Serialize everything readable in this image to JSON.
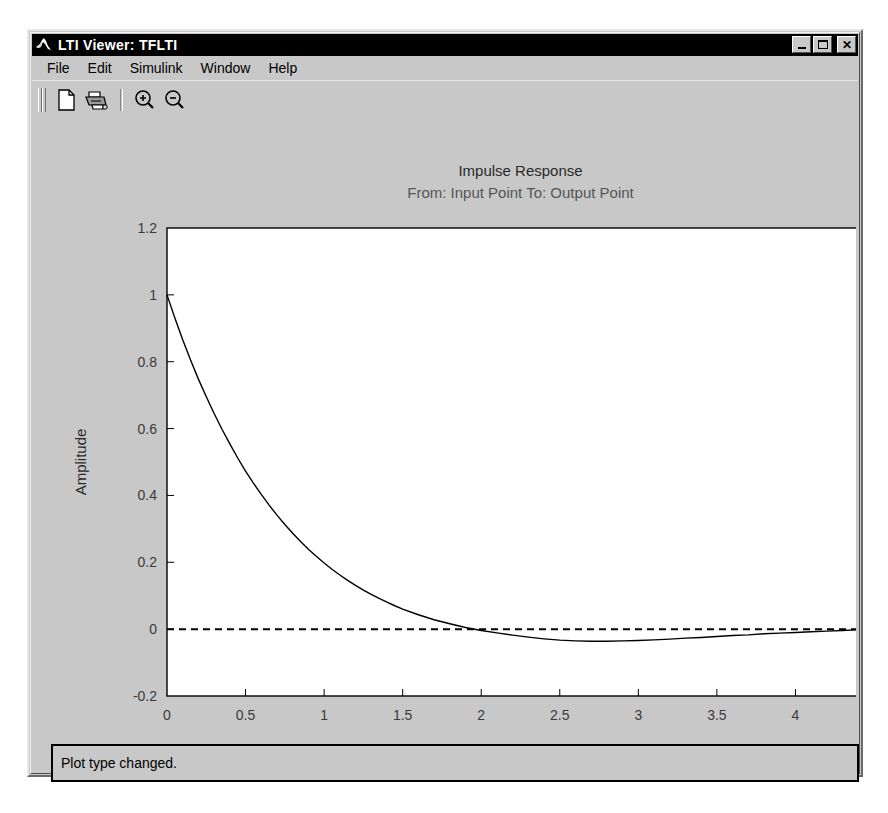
{
  "window": {
    "title": "LTI Viewer: TFLTI",
    "icon": "matlab-membrane-icon",
    "controls": [
      {
        "name": "minimize-button",
        "glyph": "minimize"
      },
      {
        "name": "maximize-button",
        "glyph": "maximize"
      },
      {
        "name": "close-button",
        "glyph": "close",
        "label": "✕"
      }
    ]
  },
  "menubar": {
    "items": [
      {
        "label": "File"
      },
      {
        "label": "Edit"
      },
      {
        "label": "Simulink"
      },
      {
        "label": "Window"
      },
      {
        "label": "Help"
      }
    ]
  },
  "toolbar": {
    "items": [
      {
        "name": "new-document-button",
        "icon": "new-document-icon"
      },
      {
        "name": "print-button",
        "icon": "printer-icon"
      },
      {
        "name": "zoom-in-button",
        "icon": "magnifier-plus-icon"
      },
      {
        "name": "zoom-out-button",
        "icon": "magnifier-minus-icon"
      }
    ]
  },
  "statusbar": {
    "message": "Plot type changed."
  },
  "chart_data": {
    "type": "line",
    "title": "Impulse Response",
    "subtitle": "From: Input Point  To: Output Point",
    "xlabel": "Time (sec)",
    "ylabel": "Amplitude",
    "xlim": [
      0,
      4.5
    ],
    "ylim": [
      -0.2,
      1.2
    ],
    "xticks": [
      0,
      0.5,
      1,
      1.5,
      2,
      2.5,
      3,
      3.5,
      4,
      4.5
    ],
    "xticklabels": [
      "0",
      "0.5",
      "1",
      "1.5",
      "2",
      "2.5",
      "3",
      "3.5",
      "4",
      "4.5"
    ],
    "yticks": [
      -0.2,
      0,
      0.2,
      0.4,
      0.6,
      0.8,
      1,
      1.2
    ],
    "yticklabels": [
      "-0.2",
      "0",
      "0.2",
      "0.4",
      "0.6",
      "0.8",
      "1",
      "1.2"
    ],
    "grid": false,
    "legend": false,
    "zero_line": {
      "value": 0,
      "style": "dashed",
      "color": "#000000"
    },
    "series": [
      {
        "name": "impulse-response",
        "color": "#000000",
        "x": [
          0.0,
          0.05,
          0.1,
          0.15,
          0.2,
          0.25,
          0.3,
          0.35,
          0.4,
          0.45,
          0.5,
          0.55,
          0.6,
          0.65,
          0.7,
          0.75,
          0.8,
          0.85,
          0.9,
          0.95,
          1.0,
          1.05,
          1.1,
          1.15,
          1.2,
          1.25,
          1.3,
          1.35,
          1.4,
          1.45,
          1.5,
          1.6,
          1.7,
          1.8,
          1.9,
          2.0,
          2.1,
          2.2,
          2.3,
          2.4,
          2.5,
          2.6,
          2.7,
          2.8,
          2.9,
          3.0,
          3.1,
          3.2,
          3.3,
          3.4,
          3.5,
          3.6,
          3.7,
          3.8,
          3.9,
          4.0,
          4.1,
          4.2,
          4.3,
          4.4,
          4.5
        ],
        "y": [
          1.0,
          0.931,
          0.866,
          0.805,
          0.748,
          0.695,
          0.645,
          0.598,
          0.554,
          0.512,
          0.473,
          0.437,
          0.403,
          0.371,
          0.341,
          0.313,
          0.287,
          0.262,
          0.239,
          0.218,
          0.198,
          0.179,
          0.162,
          0.146,
          0.131,
          0.117,
          0.104,
          0.092,
          0.081,
          0.07,
          0.06,
          0.043,
          0.028,
          0.016,
          0.005,
          -0.004,
          -0.011,
          -0.018,
          -0.024,
          -0.029,
          -0.033,
          -0.035,
          -0.036,
          -0.036,
          -0.035,
          -0.034,
          -0.032,
          -0.03,
          -0.027,
          -0.025,
          -0.022,
          -0.019,
          -0.017,
          -0.014,
          -0.012,
          -0.01,
          -0.008,
          -0.006,
          -0.004,
          -0.002,
          0.0
        ]
      }
    ]
  }
}
